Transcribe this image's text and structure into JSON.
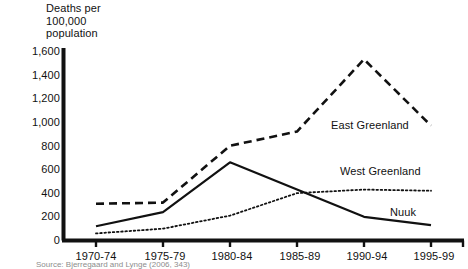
{
  "chart_data": {
    "type": "line",
    "title": "",
    "ylabel": "Deaths per\n100,000\npopulation",
    "xlabel": "",
    "categories": [
      "1970-74",
      "1975-79",
      "1980-84",
      "1985-89",
      "1990-94",
      "1995-99"
    ],
    "ylim": [
      0,
      1600
    ],
    "ytick_labels": [
      "0",
      "200",
      "400",
      "600",
      "800",
      "1,000",
      "1,200",
      "1,400",
      "1,600"
    ],
    "ytick_values": [
      0,
      200,
      400,
      600,
      800,
      1000,
      1200,
      1400,
      1600
    ],
    "grid": false,
    "legend_position": "inline-right",
    "series": [
      {
        "name": "East Greenland",
        "style": "dashed",
        "color": "#111111",
        "values": [
          310,
          320,
          800,
          920,
          1530,
          970
        ]
      },
      {
        "name": "West Greenland",
        "style": "dotted",
        "color": "#111111",
        "values": [
          60,
          100,
          210,
          400,
          430,
          420
        ]
      },
      {
        "name": "Nuuk",
        "style": "solid",
        "color": "#111111",
        "values": [
          120,
          240,
          660,
          430,
          200,
          130
        ]
      }
    ]
  },
  "labels": {
    "east_greenland": "East Greenland",
    "west_greenland": "West Greenland",
    "nuuk": "Nuuk"
  },
  "source": {
    "text": "Source: Bjerregaard and Lynge (2006, 343)"
  }
}
